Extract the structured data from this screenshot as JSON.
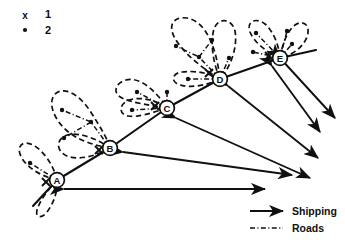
{
  "figure": {
    "width": 345,
    "height": 240,
    "background_color": "#ffffff",
    "ink_color": "#101010"
  },
  "symbol_key": {
    "items": [
      {
        "glyph": "x",
        "symbol_name": "cross-marker",
        "label": "1"
      },
      {
        "glyph": "•",
        "symbol_name": "dot-marker",
        "label": "2"
      }
    ]
  },
  "line_key": {
    "items": [
      {
        "label": "Shipping",
        "style": "solid-arrow",
        "symbol_name": "shipping-arrow"
      },
      {
        "label": "Roads",
        "style": "dash-dot-line",
        "symbol_name": "road-line"
      }
    ]
  },
  "ports": [
    {
      "id": "A",
      "label": "A",
      "cx": 57,
      "cy": 180,
      "cross_x": 46,
      "cross_y": 182
    },
    {
      "id": "B",
      "label": "B",
      "cx": 110,
      "cy": 148,
      "cross_x": 99,
      "cross_y": 150
    },
    {
      "id": "C",
      "label": "C",
      "cx": 167,
      "cy": 108,
      "cross_x": 155,
      "cross_y": 106
    },
    {
      "id": "D",
      "label": "D",
      "cx": 220,
      "cy": 79,
      "cross_x": 209,
      "cross_y": 73
    },
    {
      "id": "E",
      "label": "E",
      "cx": 280,
      "cy": 58,
      "cross_x": 269,
      "cross_y": 56
    }
  ],
  "coastline": {
    "path": "M 33 206 L 57 180 L 110 148 L 167 108 L 220 79 L 280 58 L 316 50",
    "description": "Coastline running from lower-left to upper-right through all five ports"
  },
  "hinterlands": [
    {
      "port": "A",
      "lobes": [
        "M 57 180 C 40 176 24 166 20 154 C 17 145 24 140 33 145 C 44 151 54 166 57 180 Z",
        "M 57 180 C 48 190 40 200 37 210 C 35 218 42 219 47 212 C 54 203 58 190 57 180 Z"
      ]
    },
    {
      "port": "B",
      "lobes": [
        "M 110 148 C 92 145 74 139 63 127 C 50 113 48 97 58 92 C 69 87 83 99 92 114 C 101 128 108 140 110 148 Z",
        "M 110 148 C 98 155 82 160 70 157 C 58 154 55 143 63 137 C 73 130 95 137 110 148 Z"
      ]
    },
    {
      "port": "C",
      "lobes": [
        "M 167 108 C 150 105 132 103 122 98 C 112 93 115 83 126 80 C 140 76 157 92 167 108 Z",
        "M 167 108 C 152 113 136 118 128 116 C 118 114 119 104 129 100 C 141 96 158 101 167 108 Z"
      ]
    },
    {
      "port": "D",
      "lobes": [
        "M 220 79 C 205 70 188 57 178 43 C 166 27 172 16 187 18 C 205 21 216 45 220 79 Z",
        "M 220 79 C 213 63 210 42 214 29 C 218 17 232 18 235 31 C 238 48 230 68 220 79 Z",
        "M 220 79 C 206 86 190 88 180 85 C 170 82 172 73 182 72 C 196 70 212 74 220 79 Z"
      ]
    },
    {
      "port": "E",
      "lobes": [
        "M 280 58 C 266 52 254 42 250 32 C 246 21 256 17 265 24 C 274 32 279 46 280 58 Z",
        "M 280 58 C 282 45 287 31 295 25 C 304 19 311 26 307 37 C 302 49 290 56 280 58 Z"
      ]
    }
  ],
  "settlements": [
    {
      "cx": 30,
      "cy": 163,
      "hinterland": "A"
    },
    {
      "cx": 62,
      "cy": 110,
      "hinterland": "B"
    },
    {
      "cx": 91,
      "cy": 122,
      "hinterland": "B"
    },
    {
      "cx": 64,
      "cy": 138,
      "hinterland": "B"
    },
    {
      "cx": 137,
      "cy": 92,
      "hinterland": "C"
    },
    {
      "cx": 167,
      "cy": 92,
      "hinterland": "C"
    },
    {
      "cx": 132,
      "cy": 110,
      "hinterland": "C"
    },
    {
      "cx": 176,
      "cy": 46,
      "hinterland": "D"
    },
    {
      "cx": 199,
      "cy": 57,
      "hinterland": "D"
    },
    {
      "cx": 212,
      "cy": 40,
      "hinterland": "D"
    },
    {
      "cx": 229,
      "cy": 58,
      "hinterland": "D"
    },
    {
      "cx": 188,
      "cy": 79,
      "hinterland": "D"
    },
    {
      "cx": 256,
      "cy": 33,
      "hinterland": "E"
    },
    {
      "cx": 287,
      "cy": 31,
      "hinterland": "E"
    },
    {
      "cx": 253,
      "cy": 52,
      "hinterland": "E"
    },
    {
      "cx": 292,
      "cy": 44,
      "hinterland": "E"
    }
  ],
  "roads": [
    "M 57 180 L 30 163",
    "M 110 148 L 91 122 L 62 110",
    "M 91 122 L 64 138",
    "M 167 108 L 137 92",
    "M 167 108 L 167 92",
    "M 167 108 L 132 110",
    "M 220 79 L 199 57 L 176 46",
    "M 199 57 L 212 40",
    "M 220 79 L 229 58",
    "M 220 79 L 188 79",
    "M 280 58 L 287 31",
    "M 280 58 L 256 33",
    "M 280 58 L 253 52",
    "M 280 58 L 292 44"
  ],
  "shipping_routes": [
    {
      "from": "E",
      "x1": 280,
      "y1": 58,
      "x2": 335,
      "y2": 118,
      "double_headed": true
    },
    {
      "from": "E",
      "x1": 272,
      "y1": 66,
      "x2": 320,
      "y2": 132,
      "double_headed": true
    },
    {
      "from": "D",
      "x1": 228,
      "y1": 86,
      "x2": 318,
      "y2": 158,
      "double_headed": true
    },
    {
      "from": "C",
      "x1": 176,
      "y1": 118,
      "x2": 310,
      "y2": 178,
      "double_headed": true
    },
    {
      "from": "B",
      "x1": 123,
      "y1": 152,
      "x2": 292,
      "y2": 175,
      "double_headed": true
    },
    {
      "from": "A",
      "x1": 64,
      "y1": 189,
      "x2": 265,
      "y2": 189,
      "double_headed": true
    }
  ]
}
